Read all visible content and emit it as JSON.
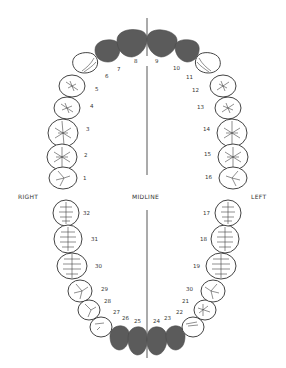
{
  "diagram": {
    "orientation_labels": {
      "right": "RIGHT",
      "midline": "MIDLINE",
      "left": "LEFT"
    },
    "colors": {
      "shaded_tooth": "#5b5b5b",
      "outline": "#444444",
      "background": "#ffffff"
    },
    "upper_arch": {
      "teeth": [
        {
          "number": "1",
          "shaded": false
        },
        {
          "number": "2",
          "shaded": false
        },
        {
          "number": "3",
          "shaded": false
        },
        {
          "number": "4",
          "shaded": false
        },
        {
          "number": "5",
          "shaded": false
        },
        {
          "number": "6",
          "shaded": false
        },
        {
          "number": "7",
          "shaded": true
        },
        {
          "number": "8",
          "shaded": true
        },
        {
          "number": "9",
          "shaded": true
        },
        {
          "number": "10",
          "shaded": true
        },
        {
          "number": "11",
          "shaded": false
        },
        {
          "number": "12",
          "shaded": false
        },
        {
          "number": "13",
          "shaded": false
        },
        {
          "number": "14",
          "shaded": false
        },
        {
          "number": "15",
          "shaded": false
        },
        {
          "number": "16",
          "shaded": false
        }
      ]
    },
    "lower_arch": {
      "teeth": [
        {
          "number": "17",
          "shaded": false
        },
        {
          "number": "18",
          "shaded": false
        },
        {
          "number": "19",
          "shaded": false
        },
        {
          "number": "30",
          "shaded": false,
          "note": "printed as 30 at position of tooth 20"
        },
        {
          "number": "21",
          "shaded": false
        },
        {
          "number": "22",
          "shaded": false
        },
        {
          "number": "23",
          "shaded": true
        },
        {
          "number": "24",
          "shaded": true
        },
        {
          "number": "25",
          "shaded": true
        },
        {
          "number": "26",
          "shaded": true
        },
        {
          "number": "27",
          "shaded": false
        },
        {
          "number": "28",
          "shaded": false
        },
        {
          "number": "29",
          "shaded": false
        },
        {
          "number": "30",
          "shaded": false
        },
        {
          "number": "31",
          "shaded": false
        },
        {
          "number": "32",
          "shaded": false
        }
      ]
    }
  }
}
